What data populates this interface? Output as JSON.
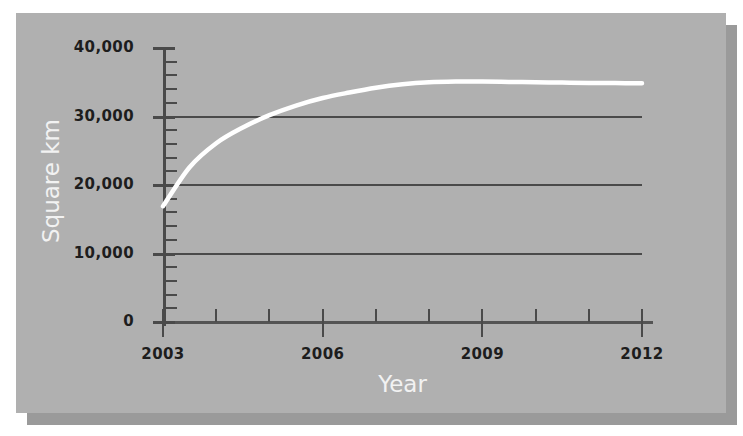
{
  "chart_data": {
    "type": "line",
    "title": "",
    "xlabel": "Year",
    "ylabel": "Square km",
    "xlim": [
      2003,
      2012
    ],
    "ylim": [
      0,
      40000
    ],
    "grid": true,
    "legend": "none",
    "line_color": "#ffffff",
    "background_color": "#b0b0b0",
    "shadow_color": "#9a9a9a",
    "axis_color": "#4a4a4a",
    "tick_label_color": "#1d1d1d",
    "axis_label_color": "#f2f2f2",
    "x_major_ticks": [
      2003,
      2006,
      2009,
      2012
    ],
    "x_major_tick_labels": [
      "2003",
      "2006",
      "2009",
      "2012"
    ],
    "x_minor_ticks": [
      2004,
      2005,
      2007,
      2008,
      2010,
      2011
    ],
    "y_major_ticks": [
      0,
      10000,
      20000,
      30000,
      40000
    ],
    "y_major_tick_labels": [
      "0",
      "10,000",
      "20,000",
      "30,000",
      "40,000"
    ],
    "y_minor_tick_step": 2000,
    "gridlines_at": [
      10000,
      20000,
      30000
    ],
    "x": [
      2003,
      2003.5,
      2004,
      2004.5,
      2005,
      2005.5,
      2006,
      2006.5,
      2007,
      2007.5,
      2008,
      2008.5,
      2009,
      2009.5,
      2010,
      2010.5,
      2011,
      2011.5,
      2012
    ],
    "values": [
      16900,
      22600,
      26100,
      28400,
      30200,
      31600,
      32700,
      33500,
      34200,
      34700,
      35000,
      35100,
      35100,
      35050,
      35000,
      34950,
      34900,
      34880,
      34850
    ],
    "series": [
      {
        "name": "Square km",
        "values": [
          16900,
          22600,
          26100,
          28400,
          30200,
          31600,
          32700,
          33500,
          34200,
          34700,
          35000,
          35100,
          35100,
          35050,
          35000,
          34950,
          34900,
          34880,
          34850
        ]
      }
    ],
    "annotations": []
  }
}
